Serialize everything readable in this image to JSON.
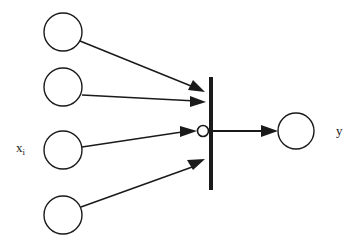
{
  "diagram": {
    "stroke_color": "#1a1a1a",
    "background_color": "#ffffff",
    "labels": {
      "input_label_base": "x",
      "input_label_subscript": "i",
      "output_label": "y"
    },
    "input_nodes": [
      {
        "id": "input-node-1",
        "cx": 63,
        "cy": 32,
        "r": 19
      },
      {
        "id": "input-node-2",
        "cx": 63,
        "cy": 87,
        "r": 19
      },
      {
        "id": "input-node-3",
        "cx": 63,
        "cy": 150,
        "r": 19
      },
      {
        "id": "input-node-4",
        "cx": 63,
        "cy": 215,
        "r": 19
      }
    ],
    "edges": [
      {
        "id": "edge-1",
        "from": "input-node-1",
        "x1": 80,
        "y1": 41,
        "x2": 204,
        "y2": 91
      },
      {
        "id": "edge-2",
        "from": "input-node-2",
        "x1": 82,
        "y1": 95,
        "x2": 204,
        "y2": 101
      },
      {
        "id": "edge-3",
        "from": "input-node-3",
        "x1": 82,
        "y1": 147,
        "x2": 190,
        "y2": 131
      },
      {
        "id": "edge-4",
        "from": "input-node-4",
        "x1": 81,
        "y1": 207,
        "x2": 203,
        "y2": 162
      }
    ],
    "summing_bar": {
      "id": "weight-bar",
      "x": 209,
      "y": 77,
      "width": 4,
      "height": 113
    },
    "summing_junction": {
      "id": "summing-junction",
      "cx": 203,
      "cy": 131,
      "r": 5
    },
    "output_edge": {
      "id": "output-edge",
      "x1": 211,
      "y1": 131,
      "x2": 276,
      "y2": 131
    },
    "output_node": {
      "id": "output-node",
      "cx": 296,
      "cy": 131,
      "r": 18
    }
  }
}
